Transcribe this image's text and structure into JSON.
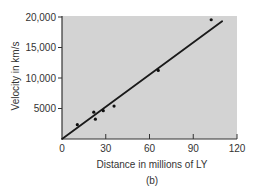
{
  "chart_data": {
    "type": "scatter",
    "title": "",
    "xlabel": "Distance in millions of LY",
    "ylabel": "Velocity in km/s",
    "caption": "(b)",
    "xlim": [
      0,
      120
    ],
    "ylim": [
      0,
      20000
    ],
    "xticks": [
      0,
      30,
      60,
      90,
      120
    ],
    "xtick_labels": [
      "0",
      "30",
      "60",
      "90",
      "120"
    ],
    "yticks": [
      5000,
      10000,
      15000,
      20000
    ],
    "ytick_labels": [
      "5000",
      "10,000",
      "15,000",
      "20,000"
    ],
    "grid": false,
    "legend": null,
    "series": [
      {
        "name": "galaxies",
        "kind": "scatter",
        "points": [
          {
            "x": 10.5,
            "y": 2350
          },
          {
            "x": 21.8,
            "y": 4400
          },
          {
            "x": 22.9,
            "y": 3250
          },
          {
            "x": 28.3,
            "y": 4650
          },
          {
            "x": 35.7,
            "y": 5400
          },
          {
            "x": 66,
            "y": 11250
          },
          {
            "x": 102.3,
            "y": 19550
          }
        ]
      },
      {
        "name": "best-fit line",
        "kind": "line",
        "points": [
          {
            "x": 0,
            "y": 0
          },
          {
            "x": 109.8,
            "y": 19300
          }
        ]
      }
    ]
  },
  "colors": {
    "plot_background": "#d3d3d3",
    "axis": "#333333",
    "line": "#1a1a1a",
    "marker": "#111111"
  }
}
